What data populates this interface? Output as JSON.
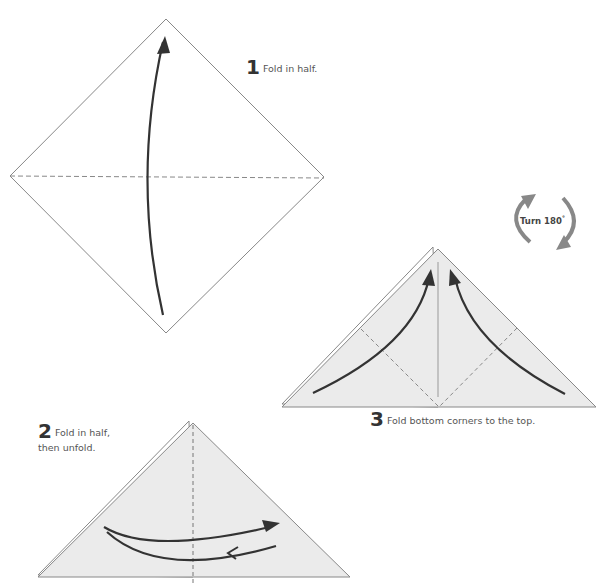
{
  "steps": [
    {
      "number": "1",
      "text": "Fold in half."
    },
    {
      "number": "2",
      "text_line1": "Fold in half,",
      "text_line2": "then unfold."
    },
    {
      "number": "3",
      "text": "Fold bottom corners to the top."
    }
  ],
  "turn": {
    "label": "Turn 180",
    "degree": "°"
  },
  "colors": {
    "paper_fill": "#ffffff",
    "folded_fill": "#ebebeb",
    "outline": "#888888",
    "arrow": "#333333",
    "turn_arrow": "#888888"
  }
}
